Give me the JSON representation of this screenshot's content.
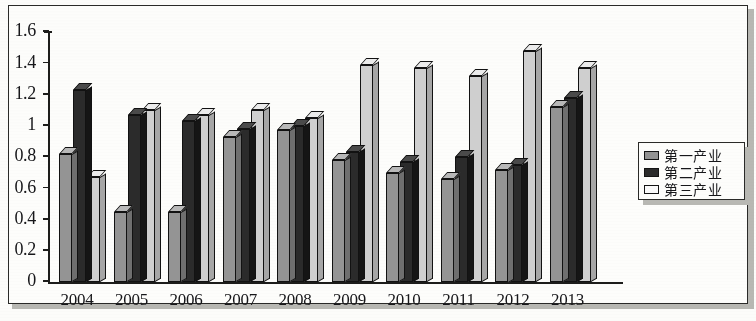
{
  "chart_data": {
    "type": "bar",
    "title": "",
    "xlabel": "",
    "ylabel": "",
    "ylim": [
      0,
      1.6
    ],
    "yticks": [
      "0",
      "0.2",
      "0.4",
      "0.6",
      "0.8",
      "1",
      "1.2",
      "1.4",
      "1.6"
    ],
    "ytick_values": [
      0,
      0.2,
      0.4,
      0.6,
      0.8,
      1,
      1.2,
      1.4,
      1.6
    ],
    "grid": false,
    "legend_position": "right",
    "categories": [
      "2004",
      "2005",
      "2006",
      "2007",
      "2008",
      "2009",
      "2010",
      "2011",
      "2012",
      "2013"
    ],
    "series": [
      {
        "name": "第一产业",
        "color": "#949494",
        "values": [
          0.82,
          0.45,
          0.45,
          0.93,
          0.97,
          0.78,
          0.7,
          0.66,
          0.72,
          1.12
        ]
      },
      {
        "name": "第二产业",
        "color": "#2b2b2b",
        "values": [
          1.23,
          1.07,
          1.03,
          0.98,
          1.0,
          0.83,
          0.77,
          0.8,
          0.75,
          1.18
        ]
      },
      {
        "name": "第三产业",
        "color": "#ffffff",
        "values": [
          0.67,
          1.1,
          1.07,
          1.1,
          1.05,
          1.39,
          1.37,
          1.32,
          1.48,
          1.37
        ]
      }
    ]
  },
  "legend": {
    "items": [
      {
        "label": "第一产业",
        "swatch": "gray"
      },
      {
        "label": "第二产业",
        "swatch": "dark"
      },
      {
        "label": "第三产业",
        "swatch": "white"
      }
    ]
  }
}
